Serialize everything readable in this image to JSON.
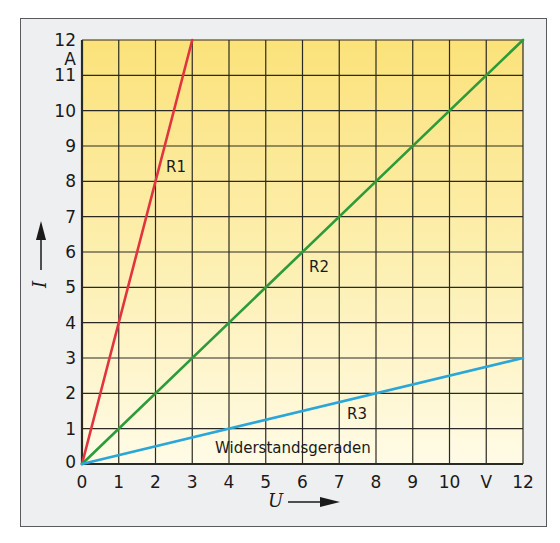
{
  "chart_data": {
    "type": "line",
    "title": "Widerstandsgeraden",
    "xlabel": "U",
    "xunit": "V",
    "ylabel": "I",
    "yunit": "A",
    "xlim": [
      0,
      12
    ],
    "ylim": [
      0,
      12
    ],
    "grid": true,
    "x_ticks": [
      "0",
      "1",
      "2",
      "3",
      "4",
      "5",
      "6",
      "7",
      "8",
      "9",
      "10",
      "V",
      "12"
    ],
    "y_ticks": [
      "0",
      "1",
      "2",
      "3",
      "4",
      "5",
      "6",
      "7",
      "8",
      "9",
      "10",
      "11",
      "A",
      "12"
    ],
    "series": [
      {
        "name": "R1",
        "color": "#e2343f",
        "x": [
          0,
          3
        ],
        "y": [
          0,
          12
        ]
      },
      {
        "name": "R2",
        "color": "#2e9a3a",
        "x": [
          0,
          12
        ],
        "y": [
          0,
          12
        ]
      },
      {
        "name": "R3",
        "color": "#2aa7d8",
        "x": [
          0,
          12
        ],
        "y": [
          0,
          3
        ]
      }
    ],
    "annotations": [
      {
        "text": "R1",
        "x": 2.3,
        "y": 8.6
      },
      {
        "text": "R2",
        "x": 6.1,
        "y": 5.8
      },
      {
        "text": "R3",
        "x": 7.1,
        "y": 1.6
      },
      {
        "text": "Widerstandsgeraden",
        "x": 4.7,
        "y": 0.55
      }
    ]
  },
  "labels": {
    "title": "Widerstandsgeraden",
    "r1": "R1",
    "r2": "R2",
    "r3": "R3",
    "x_var": "U",
    "y_var": "I",
    "x_unit": "V",
    "y_unit": "A"
  }
}
